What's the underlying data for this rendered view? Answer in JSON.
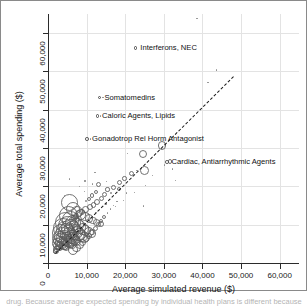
{
  "figure": {
    "background": "#ffffff",
    "frame_color": "#8a8a8a"
  },
  "caption": {
    "text": "drug. Because average expected spending by individual health plans is different because"
  },
  "chart_data": {
    "type": "scatter",
    "title": "",
    "subtitle": "",
    "xlabel": "Average simulated revenue ($)",
    "ylabel": "Average total spending ($)",
    "xlim": [
      0,
      65000
    ],
    "ylim": [
      0,
      65000
    ],
    "xticks": [
      0,
      10000,
      20000,
      30000,
      40000,
      50000,
      60000
    ],
    "yticks": [
      0,
      10000,
      20000,
      30000,
      40000,
      50000,
      60000
    ],
    "xticklabels": [
      "0",
      "10,000",
      "20,000",
      "30,000",
      "40,000",
      "50,000",
      "60,000"
    ],
    "yticklabels": [
      "0",
      "10,000",
      "20,000",
      "30,000",
      "40,000",
      "50,000",
      "60,000"
    ],
    "grid": true,
    "grid_color": "#e3e3e3",
    "legend": null,
    "marker_style": "open circle, size proportional to group size",
    "marker_color": "#5a5a5a",
    "reference_line": {
      "style": "dashed",
      "color": "#1b1b1b",
      "label": "identity line (y = x)",
      "x": [
        1800,
        48000
      ],
      "y": [
        2600,
        48800
      ]
    },
    "annotations": [
      {
        "label": "Interferons, NEC",
        "x": 23500,
        "y": 56200,
        "point_x": 38600,
        "point_y": 63800
      },
      {
        "label": "Somatomedins",
        "x": 14200,
        "y": 43200,
        "point_x": 14200,
        "point_y": 43200
      },
      {
        "label": "Caloric Agents, Lipids",
        "x": 13600,
        "y": 38400,
        "point_x": 13600,
        "point_y": 38400
      },
      {
        "label": "Gonadotrop Rel Horm Antagonist",
        "x": 11000,
        "y": 32400,
        "point_x": 11000,
        "point_y": 32400
      },
      {
        "label": "Cardiac, Antiarrhythmic Agents",
        "x": 31600,
        "y": 26400,
        "point_x": 31600,
        "point_y": 26400
      }
    ],
    "points": [
      {
        "x": 38600,
        "y": 63800,
        "r": 1.6
      },
      {
        "x": 41400,
        "y": 47100,
        "r": 1.3
      },
      {
        "x": 43600,
        "y": 50400,
        "r": 1.1
      },
      {
        "x": 14200,
        "y": 43200,
        "r": 1.8
      },
      {
        "x": 13600,
        "y": 38400,
        "r": 1.8
      },
      {
        "x": 11000,
        "y": 32400,
        "r": 1.8
      },
      {
        "x": 31600,
        "y": 26400,
        "r": 2.4
      },
      {
        "x": 32200,
        "y": 24500,
        "r": 1.4
      },
      {
        "x": 29600,
        "y": 30700,
        "r": 4.2
      },
      {
        "x": 24600,
        "y": 28400,
        "r": 4.0
      },
      {
        "x": 20600,
        "y": 28600,
        "r": 1.3
      },
      {
        "x": 25000,
        "y": 24100,
        "r": 4.4
      },
      {
        "x": 23000,
        "y": 24200,
        "r": 1.5
      },
      {
        "x": 21600,
        "y": 23400,
        "r": 2.8
      },
      {
        "x": 19800,
        "y": 22100,
        "r": 2.2
      },
      {
        "x": 18600,
        "y": 21000,
        "r": 2.6
      },
      {
        "x": 18400,
        "y": 19300,
        "r": 2.0
      },
      {
        "x": 17000,
        "y": 19700,
        "r": 2.4
      },
      {
        "x": 16400,
        "y": 18300,
        "r": 1.8
      },
      {
        "x": 15400,
        "y": 19200,
        "r": 2.1
      },
      {
        "x": 14600,
        "y": 17900,
        "r": 2.6
      },
      {
        "x": 20400,
        "y": 18300,
        "r": 1.2
      },
      {
        "x": 5600,
        "y": 21900,
        "r": 1.3
      },
      {
        "x": 9600,
        "y": 21400,
        "r": 1.2
      },
      {
        "x": 12200,
        "y": 23700,
        "r": 1.2
      },
      {
        "x": 8200,
        "y": 19900,
        "r": 1.2
      },
      {
        "x": 17400,
        "y": 14700,
        "r": 1.2
      },
      {
        "x": 13000,
        "y": 20400,
        "r": 2.6
      },
      {
        "x": 12400,
        "y": 18600,
        "r": 2.2
      },
      {
        "x": 11400,
        "y": 17600,
        "r": 2.4
      },
      {
        "x": 10600,
        "y": 16800,
        "r": 2.0
      },
      {
        "x": 9800,
        "y": 16100,
        "r": 1.9
      },
      {
        "x": 13800,
        "y": 16800,
        "r": 2.6
      },
      {
        "x": 12800,
        "y": 16000,
        "r": 3.0
      },
      {
        "x": 11800,
        "y": 15200,
        "r": 2.8
      },
      {
        "x": 10800,
        "y": 14600,
        "r": 3.2
      },
      {
        "x": 9800,
        "y": 14000,
        "r": 3.4
      },
      {
        "x": 8800,
        "y": 13400,
        "r": 3.0
      },
      {
        "x": 8000,
        "y": 12900,
        "r": 3.6
      },
      {
        "x": 7200,
        "y": 12300,
        "r": 3.2
      },
      {
        "x": 6600,
        "y": 11800,
        "r": 2.8
      },
      {
        "x": 6000,
        "y": 11300,
        "r": 2.6
      },
      {
        "x": 5600,
        "y": 15800,
        "r": 8.5
      },
      {
        "x": 6400,
        "y": 14200,
        "r": 7.0
      },
      {
        "x": 7400,
        "y": 13300,
        "r": 6.0
      },
      {
        "x": 8600,
        "y": 12700,
        "r": 5.2
      },
      {
        "x": 9600,
        "y": 12100,
        "r": 4.6
      },
      {
        "x": 10600,
        "y": 11600,
        "r": 4.2
      },
      {
        "x": 11600,
        "y": 11100,
        "r": 3.8
      },
      {
        "x": 12600,
        "y": 10600,
        "r": 3.4
      },
      {
        "x": 13600,
        "y": 10100,
        "r": 3.0
      },
      {
        "x": 5200,
        "y": 12400,
        "r": 9.5
      },
      {
        "x": 5800,
        "y": 11200,
        "r": 8.8
      },
      {
        "x": 6600,
        "y": 10500,
        "r": 8.0
      },
      {
        "x": 7400,
        "y": 9900,
        "r": 7.4
      },
      {
        "x": 8200,
        "y": 9400,
        "r": 6.8
      },
      {
        "x": 9000,
        "y": 8900,
        "r": 6.2
      },
      {
        "x": 9800,
        "y": 8400,
        "r": 5.6
      },
      {
        "x": 10600,
        "y": 8000,
        "r": 5.0
      },
      {
        "x": 11400,
        "y": 7600,
        "r": 4.4
      },
      {
        "x": 4600,
        "y": 10600,
        "r": 10.5
      },
      {
        "x": 5200,
        "y": 9800,
        "r": 9.8
      },
      {
        "x": 5800,
        "y": 9200,
        "r": 9.2
      },
      {
        "x": 6400,
        "y": 8700,
        "r": 8.6
      },
      {
        "x": 7000,
        "y": 8200,
        "r": 8.0
      },
      {
        "x": 7600,
        "y": 7800,
        "r": 7.4
      },
      {
        "x": 8200,
        "y": 7400,
        "r": 6.8
      },
      {
        "x": 8800,
        "y": 7000,
        "r": 6.2
      },
      {
        "x": 9400,
        "y": 6600,
        "r": 5.6
      },
      {
        "x": 4000,
        "y": 9200,
        "r": 10.0
      },
      {
        "x": 4400,
        "y": 8600,
        "r": 9.4
      },
      {
        "x": 4800,
        "y": 8100,
        "r": 8.8
      },
      {
        "x": 5200,
        "y": 7700,
        "r": 8.2
      },
      {
        "x": 5600,
        "y": 7300,
        "r": 7.6
      },
      {
        "x": 6000,
        "y": 6900,
        "r": 7.0
      },
      {
        "x": 6400,
        "y": 6500,
        "r": 6.4
      },
      {
        "x": 6800,
        "y": 6100,
        "r": 5.8
      },
      {
        "x": 7200,
        "y": 5800,
        "r": 5.2
      },
      {
        "x": 3400,
        "y": 7800,
        "r": 9.0
      },
      {
        "x": 3800,
        "y": 7200,
        "r": 8.4
      },
      {
        "x": 4200,
        "y": 6700,
        "r": 7.8
      },
      {
        "x": 4600,
        "y": 6300,
        "r": 7.2
      },
      {
        "x": 5000,
        "y": 5900,
        "r": 6.6
      },
      {
        "x": 5400,
        "y": 5500,
        "r": 6.0
      },
      {
        "x": 5800,
        "y": 5200,
        "r": 5.4
      },
      {
        "x": 6200,
        "y": 4900,
        "r": 4.8
      },
      {
        "x": 2900,
        "y": 6400,
        "r": 7.6
      },
      {
        "x": 3200,
        "y": 5900,
        "r": 7.0
      },
      {
        "x": 3500,
        "y": 5500,
        "r": 6.4
      },
      {
        "x": 3800,
        "y": 5100,
        "r": 5.8
      },
      {
        "x": 4100,
        "y": 4800,
        "r": 5.2
      },
      {
        "x": 4400,
        "y": 4500,
        "r": 4.6
      },
      {
        "x": 4700,
        "y": 4200,
        "r": 4.0
      },
      {
        "x": 2400,
        "y": 5000,
        "r": 5.4
      },
      {
        "x": 2600,
        "y": 4600,
        "r": 4.8
      },
      {
        "x": 2800,
        "y": 4300,
        "r": 4.2
      },
      {
        "x": 3000,
        "y": 4000,
        "r": 3.6
      },
      {
        "x": 2200,
        "y": 3600,
        "r": 3.2
      },
      {
        "x": 2000,
        "y": 3200,
        "r": 2.8
      },
      {
        "x": 1900,
        "y": 2900,
        "r": 2.4
      },
      {
        "x": 6600,
        "y": 3300,
        "r": 5.0
      },
      {
        "x": 7400,
        "y": 3900,
        "r": 4.4
      },
      {
        "x": 8200,
        "y": 4600,
        "r": 4.0
      },
      {
        "x": 9000,
        "y": 5400,
        "r": 3.6
      },
      {
        "x": 9800,
        "y": 6200,
        "r": 3.2
      },
      {
        "x": 10600,
        "y": 7000,
        "r": 3.0
      },
      {
        "x": 11400,
        "y": 8000,
        "r": 2.8
      },
      {
        "x": 12200,
        "y": 9000,
        "r": 2.6
      },
      {
        "x": 13000,
        "y": 10000,
        "r": 2.4
      },
      {
        "x": 13800,
        "y": 11000,
        "r": 2.2
      },
      {
        "x": 14600,
        "y": 12000,
        "r": 2.0
      },
      {
        "x": 15400,
        "y": 13000,
        "r": 1.8
      },
      {
        "x": 16200,
        "y": 14000,
        "r": 1.7
      },
      {
        "x": 17000,
        "y": 15000,
        "r": 1.6
      },
      {
        "x": 17800,
        "y": 16000,
        "r": 1.5
      },
      {
        "x": 3000,
        "y": 11800,
        "r": 1.2
      },
      {
        "x": 11600,
        "y": 20600,
        "r": 1.1
      },
      {
        "x": 15200,
        "y": 21200,
        "r": 1.1
      },
      {
        "x": 19600,
        "y": 16400,
        "r": 1.1
      },
      {
        "x": 22400,
        "y": 18400,
        "r": 1.1
      },
      {
        "x": 25200,
        "y": 20200,
        "r": 1.1
      },
      {
        "x": 24800,
        "y": 14900,
        "r": 1.0
      },
      {
        "x": 27000,
        "y": 22800,
        "r": 1.1
      },
      {
        "x": 12400,
        "y": 13200,
        "r": 1.0
      },
      {
        "x": 15000,
        "y": 15400,
        "r": 1.0
      },
      {
        "x": 4200,
        "y": 17600,
        "r": 1.0
      },
      {
        "x": 9400,
        "y": 18600,
        "r": 1.0
      },
      {
        "x": 33000,
        "y": 21600,
        "r": 1.0
      },
      {
        "x": 30200,
        "y": 25600,
        "r": 1.0
      }
    ]
  }
}
